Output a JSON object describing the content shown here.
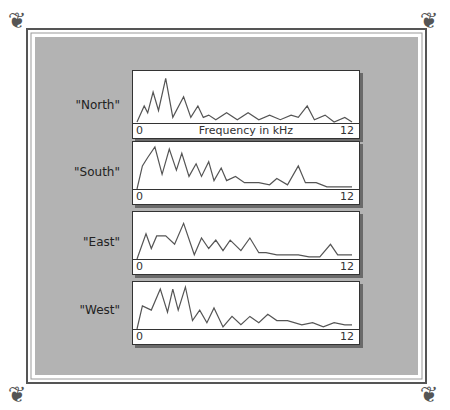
{
  "frame": {
    "background": "#b3b3b3",
    "border_color": "#555555"
  },
  "x_axis": {
    "label": "Frequency in kHz",
    "min": "0",
    "max": "12"
  },
  "panels": [
    {
      "label": "\"North\"",
      "min": "0",
      "max": "12",
      "xlabel": "Frequency in kHz"
    },
    {
      "label": "\"South\"",
      "min": "0",
      "max": "12"
    },
    {
      "label": "\"East\"",
      "min": "0",
      "max": "12"
    },
    {
      "label": "\"West\"",
      "min": "0",
      "max": "12"
    }
  ],
  "chart_data": {
    "type": "line",
    "title": "",
    "xlabel": "Frequency in kHz",
    "xlim": [
      0,
      12
    ],
    "series": [
      {
        "name": "North",
        "x": [
          0,
          0.4,
          0.6,
          0.9,
          1.2,
          1.6,
          2.0,
          2.6,
          3.0,
          3.4,
          3.7,
          4.0,
          4.4,
          5.0,
          5.6,
          6.2,
          6.8,
          7.4,
          8.0,
          8.6,
          9.0,
          9.5,
          9.9,
          10.5,
          11.0,
          11.6,
          12
        ],
        "y": [
          0,
          0.35,
          0.2,
          0.65,
          0.25,
          0.95,
          0.1,
          0.55,
          0.1,
          0.35,
          0.1,
          0.15,
          0.05,
          0.2,
          0.05,
          0.2,
          0.05,
          0.15,
          0.05,
          0.15,
          0.1,
          0.35,
          0.05,
          0.15,
          0.0,
          0.1,
          0.0
        ]
      },
      {
        "name": "South",
        "x": [
          0,
          0.3,
          0.6,
          1.0,
          1.4,
          1.8,
          2.2,
          2.5,
          2.9,
          3.3,
          3.6,
          4.0,
          4.3,
          4.7,
          5.0,
          5.5,
          6.0,
          6.8,
          7.4,
          7.8,
          8.4,
          9.0,
          9.4,
          10.0,
          10.6,
          11.2,
          12
        ],
        "y": [
          0,
          0.55,
          0.75,
          1.0,
          0.35,
          0.95,
          0.45,
          0.85,
          0.3,
          0.6,
          0.3,
          0.65,
          0.2,
          0.5,
          0.2,
          0.3,
          0.15,
          0.15,
          0.1,
          0.25,
          0.1,
          0.55,
          0.15,
          0.15,
          0.05,
          0.05,
          0.05
        ]
      },
      {
        "name": "East",
        "x": [
          0,
          0.5,
          0.8,
          1.1,
          1.6,
          2.1,
          2.6,
          3.2,
          3.6,
          4.0,
          4.4,
          4.8,
          5.2,
          5.8,
          6.3,
          6.8,
          7.2,
          7.8,
          8.4,
          9.0,
          9.6,
          10.2,
          10.8,
          11.2,
          11.6,
          12
        ],
        "y": [
          0,
          0.6,
          0.25,
          0.55,
          0.55,
          0.35,
          0.85,
          0.1,
          0.5,
          0.25,
          0.45,
          0.2,
          0.45,
          0.2,
          0.5,
          0.15,
          0.15,
          0.1,
          0.1,
          0.1,
          0.05,
          0.05,
          0.35,
          0.1,
          0.1,
          0.1
        ]
      },
      {
        "name": "West",
        "x": [
          0,
          0.3,
          0.8,
          1.3,
          1.7,
          2.0,
          2.3,
          2.7,
          3.1,
          3.5,
          3.9,
          4.3,
          4.8,
          5.3,
          5.8,
          6.3,
          6.8,
          7.3,
          7.8,
          8.4,
          9.2,
          9.8,
          10.4,
          11.0,
          11.6,
          12
        ],
        "y": [
          0,
          0.55,
          0.45,
          0.95,
          0.4,
          0.95,
          0.45,
          1.0,
          0.2,
          0.45,
          0.15,
          0.5,
          0.05,
          0.3,
          0.1,
          0.3,
          0.15,
          0.35,
          0.2,
          0.2,
          0.1,
          0.15,
          0.05,
          0.15,
          0.1,
          0.1
        ]
      }
    ]
  }
}
